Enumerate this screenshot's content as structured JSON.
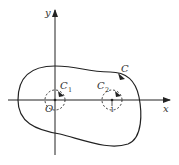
{
  "diagram": {
    "axes": {
      "x_label": "x",
      "y_label": "y",
      "origin_label": "O"
    },
    "curves": [
      {
        "name": "C",
        "label": "C",
        "subscript": "",
        "type": "closed-curve",
        "style": "solid",
        "orientation": "counterclockwise"
      },
      {
        "name": "C1",
        "label": "C",
        "subscript": "1",
        "type": "circle",
        "style": "dashed",
        "center": "O",
        "orientation": "clockwise"
      },
      {
        "name": "C2",
        "label": "C",
        "subscript": "2",
        "type": "circle",
        "style": "dashed",
        "center": "1",
        "orientation": "clockwise"
      }
    ],
    "tick_labels": [
      "1"
    ],
    "colors": {
      "stroke": "#222222",
      "background": "#ffffff"
    }
  }
}
